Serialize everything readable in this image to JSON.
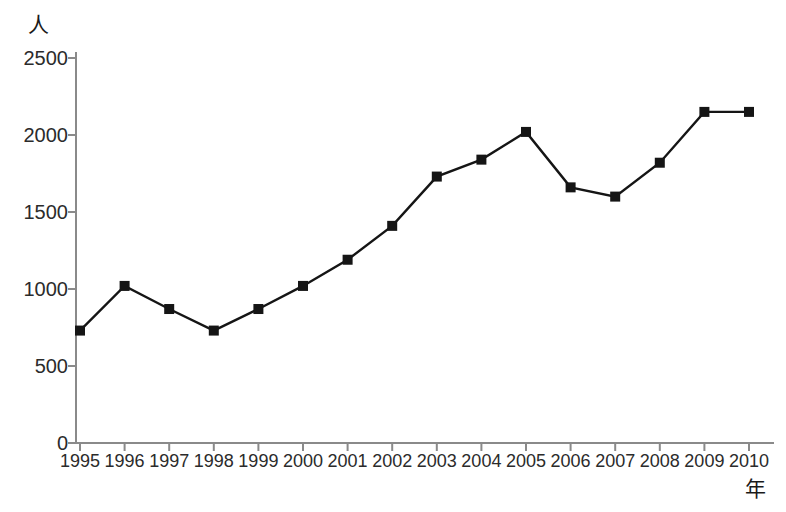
{
  "chart_data": {
    "type": "line",
    "title": "",
    "subtitle": "",
    "xlabel": "年",
    "ylabel": "人",
    "categories": [
      "1995",
      "1996",
      "1997",
      "1998",
      "1999",
      "2000",
      "2001",
      "2002",
      "2003",
      "2004",
      "2005",
      "2006",
      "2007",
      "2008",
      "2009",
      "2010"
    ],
    "values": [
      730,
      1020,
      870,
      730,
      870,
      1020,
      1190,
      1410,
      1730,
      1840,
      2020,
      1660,
      1600,
      1820,
      2150,
      2150
    ],
    "series": [
      {
        "name": "人数",
        "values": [
          730,
          1020,
          870,
          730,
          870,
          1020,
          1190,
          1410,
          1730,
          1840,
          2020,
          1660,
          1600,
          1820,
          2150,
          2150
        ]
      }
    ],
    "ylim": [
      0,
      2500
    ],
    "yticks": [
      0,
      500,
      1000,
      1500,
      2000,
      2500
    ],
    "ytick_labels": [
      "0",
      "500",
      "1000",
      "1500",
      "2000",
      "2500"
    ],
    "xtick_labels": [
      "1995",
      "1996",
      "1997",
      "1998",
      "1999",
      "2000",
      "2001",
      "2002",
      "2003",
      "2004",
      "2005",
      "2006",
      "2007",
      "2008",
      "2009",
      "2010"
    ],
    "grid": false,
    "legend": "none",
    "marker": "square",
    "line_color": "#151515",
    "marker_color": "#151515",
    "axis_color": "#8a8a8a",
    "background": "#ffffff"
  },
  "axis": {
    "y_unit": "人",
    "x_unit": "年"
  }
}
